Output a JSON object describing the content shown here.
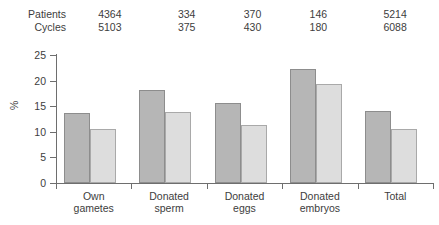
{
  "header": {
    "row_labels": [
      "Patients",
      "Cycles"
    ],
    "patients": [
      "4364",
      "334",
      "370",
      "146",
      "5214"
    ],
    "cycles": [
      "5103",
      "375",
      "430",
      "180",
      "6088"
    ]
  },
  "chart_data": {
    "type": "bar",
    "title": "",
    "xlabel": "",
    "ylabel": "%",
    "ylim": [
      0,
      25
    ],
    "yticks": [
      0,
      5,
      10,
      15,
      20,
      25
    ],
    "ytick_labels": [
      "0",
      "5",
      "10",
      "15",
      "20",
      "25"
    ],
    "grid": false,
    "legend": "none",
    "categories": [
      "Own gametes",
      "Donated sperm",
      "Donated eggs",
      "Donated embryos",
      "Total"
    ],
    "category_lines": [
      [
        "Own",
        "gametes"
      ],
      [
        "Donated",
        "sperm"
      ],
      [
        "Donated",
        "eggs"
      ],
      [
        "Donated",
        "embryos"
      ],
      [
        "Total",
        ""
      ]
    ],
    "series": [
      {
        "name": "series-1",
        "color": "#b6b6b6",
        "values": [
          13.7,
          18.1,
          15.6,
          22.2,
          14.0
        ]
      },
      {
        "name": "series-2",
        "color": "#dddddd",
        "values": [
          10.5,
          13.8,
          11.3,
          19.3,
          10.6
        ]
      }
    ]
  },
  "colors": {
    "bar_dark": "#b6b6b6",
    "bar_light": "#dddddd",
    "axis": "#6e6e6e",
    "text": "#3d3d3d",
    "background": "#ffffff"
  }
}
